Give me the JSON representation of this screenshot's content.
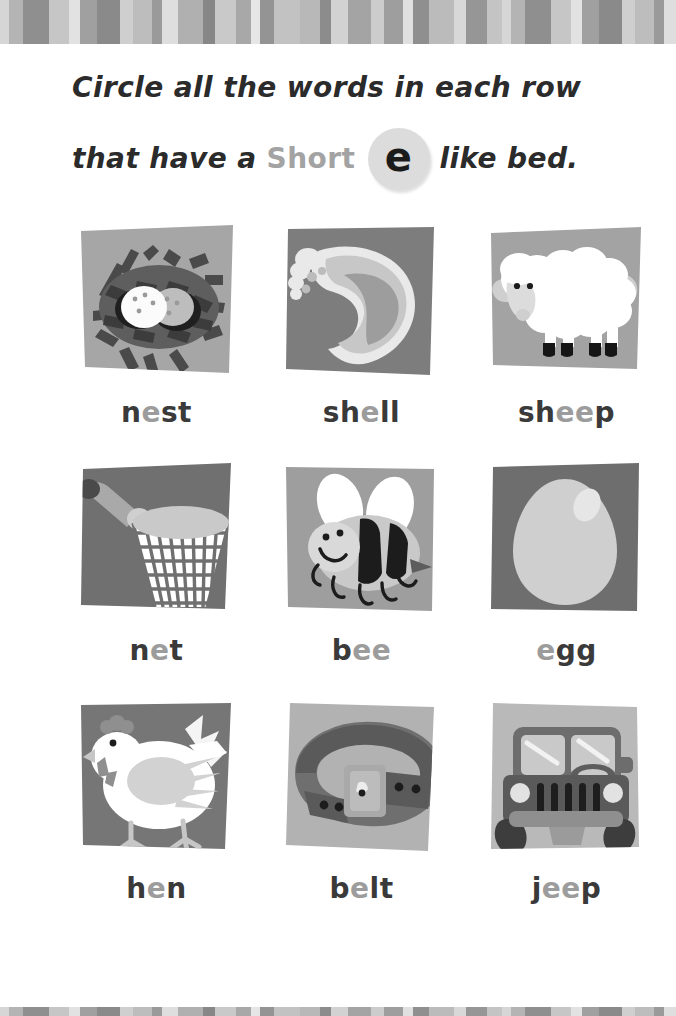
{
  "page": {
    "background": "#ffffff",
    "width": 676,
    "height": 1016
  },
  "decor": {
    "top_band_name": "top-striped-border",
    "bottom_band_name": "bottom-striped-border",
    "stripe_colors": [
      "#d6d6d6",
      "#b4b4b4",
      "#8f8f8f",
      "#c6c6c6",
      "#e2e2e2",
      "#a0a0a0",
      "#8a8a8a",
      "#cfcfcf",
      "#bdbdbd",
      "#9a9a9a",
      "#dedede",
      "#b0b0b0",
      "#878787",
      "#c9c9c9",
      "#a8a8a8",
      "#e6e6e6",
      "#949494",
      "#c2c2c2",
      "#b8b8b8",
      "#8c8c8c",
      "#d2d2d2",
      "#a4a4a4",
      "#cccccc",
      "#9e9e9e",
      "#e0e0e0",
      "#8f8f8f",
      "#bbbbbb",
      "#d8d8d8",
      "#969696",
      "#c4c4c4"
    ]
  },
  "instructions": {
    "line1": "Circle all the words in each row",
    "line2_before": "that have a",
    "short_label": "Short",
    "vowel": "e",
    "line2_after": "like bed.",
    "short_color": "#a3a3a3",
    "badge_color": "#dcdcdc",
    "text_color": "#2b2b2b"
  },
  "word_style": {
    "base_color": "#3a3a3a",
    "highlight_color": "#9c9c9c"
  },
  "rows": [
    {
      "row_label": "row-1",
      "cards": [
        {
          "name": "nest",
          "word_parts": [
            {
              "t": "n",
              "hl": false
            },
            {
              "t": "e",
              "hl": true
            },
            {
              "t": "st",
              "hl": false
            }
          ],
          "image": "nest-illustration",
          "tile_bg": "#a6a6a6"
        },
        {
          "name": "shell",
          "word_parts": [
            {
              "t": "sh",
              "hl": false
            },
            {
              "t": "e",
              "hl": true
            },
            {
              "t": "ll",
              "hl": false
            }
          ],
          "image": "shell-illustration",
          "tile_bg": "#7d7d7d"
        },
        {
          "name": "sheep",
          "word_parts": [
            {
              "t": "sh",
              "hl": false
            },
            {
              "t": "ee",
              "hl": true
            },
            {
              "t": "p",
              "hl": false
            }
          ],
          "image": "sheep-illustration",
          "tile_bg": "#a3a3a3"
        }
      ]
    },
    {
      "row_label": "row-2",
      "cards": [
        {
          "name": "net",
          "word_parts": [
            {
              "t": "n",
              "hl": false
            },
            {
              "t": "e",
              "hl": true
            },
            {
              "t": "t",
              "hl": false
            }
          ],
          "image": "net-illustration",
          "tile_bg": "#707070"
        },
        {
          "name": "bee",
          "word_parts": [
            {
              "t": "b",
              "hl": false
            },
            {
              "t": "ee",
              "hl": true
            }
          ],
          "image": "bee-illustration",
          "tile_bg": "#9e9e9e"
        },
        {
          "name": "egg",
          "word_parts": [
            {
              "t": "e",
              "hl": true
            },
            {
              "t": "gg",
              "hl": false
            }
          ],
          "image": "egg-illustration",
          "tile_bg": "#6e6e6e"
        }
      ]
    },
    {
      "row_label": "row-3",
      "cards": [
        {
          "name": "hen",
          "word_parts": [
            {
              "t": "h",
              "hl": false
            },
            {
              "t": "e",
              "hl": true
            },
            {
              "t": "n",
              "hl": false
            }
          ],
          "image": "hen-illustration",
          "tile_bg": "#767676"
        },
        {
          "name": "belt",
          "word_parts": [
            {
              "t": "b",
              "hl": false
            },
            {
              "t": "e",
              "hl": true
            },
            {
              "t": "lt",
              "hl": false
            }
          ],
          "image": "belt-illustration",
          "tile_bg": "#b2b2b2"
        },
        {
          "name": "jeep",
          "word_parts": [
            {
              "t": "j",
              "hl": false
            },
            {
              "t": "ee",
              "hl": true
            },
            {
              "t": "p",
              "hl": false
            }
          ],
          "image": "jeep-illustration",
          "tile_bg": "#b9b9b9"
        }
      ]
    }
  ]
}
